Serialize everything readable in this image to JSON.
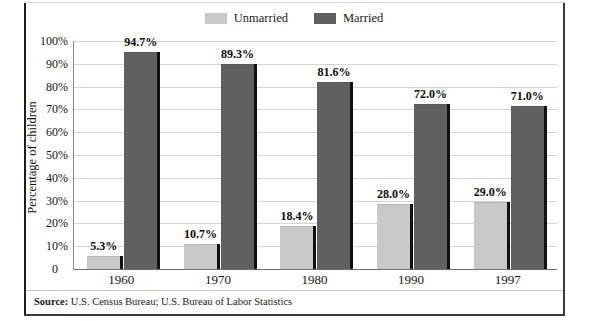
{
  "chart_data": {
    "type": "bar",
    "title": "",
    "subtitle": "",
    "xlabel": "",
    "ylabel": "Percentage of children",
    "categories": [
      "1960",
      "1970",
      "1980",
      "1990",
      "1997"
    ],
    "series": [
      {
        "name": "Unmarried",
        "color": "#c9c9c9",
        "values": [
          5.3,
          10.7,
          18.4,
          28.0,
          29.0
        ],
        "labels": [
          "5.3%",
          "10.7%",
          "18.4%",
          "28.0%",
          "29.0%"
        ]
      },
      {
        "name": "Married",
        "color": "#606060",
        "values": [
          94.7,
          89.3,
          81.6,
          72.0,
          71.0
        ],
        "labels": [
          "94.7%",
          "89.3%",
          "81.6%",
          "72.0%",
          "71.0%"
        ]
      }
    ],
    "ylim": [
      0,
      100
    ],
    "yticks": [
      100,
      90,
      80,
      70,
      60,
      50,
      40,
      30,
      20,
      10
    ],
    "ytick_labels": [
      "100%",
      "90%",
      "80%",
      "70%",
      "60%",
      "50%",
      "40%",
      "30%",
      "20%",
      "10%"
    ],
    "zero_label": "0",
    "grid": true,
    "grid_axis": "y",
    "legend_position": "top-center"
  },
  "legend": {
    "items": [
      {
        "label": "Unmarried",
        "color": "#c9c9c9"
      },
      {
        "label": "Married",
        "color": "#606060"
      }
    ]
  },
  "footer": {
    "source_prefix": "Source:",
    "source_text": "U.S. Census Bureau; U.S. Bureau of Labor Statistics"
  }
}
